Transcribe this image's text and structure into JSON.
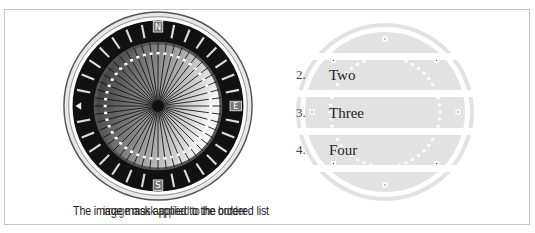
{
  "left_panel": {
    "image": "compass-icon",
    "compass_labels": {
      "north": "N",
      "east": "E",
      "south": "S"
    },
    "caption_primary": "The image mask applied to the ordered list",
    "caption_overlap": "image mask applied to the border"
  },
  "right_panel": {
    "list_items": [
      {
        "number": "1.",
        "label": "One"
      },
      {
        "number": "2.",
        "label": "Two"
      },
      {
        "number": "3.",
        "label": "Three"
      },
      {
        "number": "4.",
        "label": "Four"
      },
      {
        "number": "5.",
        "label": "Five"
      }
    ],
    "band_color": "#e2e2e2"
  },
  "colors": {
    "frame_border": "#c8c8c8",
    "compass_ring": "#111111",
    "compass_face_light": "#f2f2f2",
    "compass_face_dark": "#3a3a3a"
  }
}
